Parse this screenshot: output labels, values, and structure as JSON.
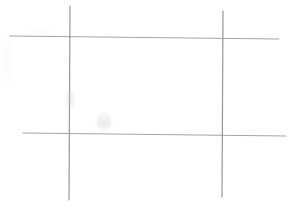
{
  "image": {
    "kind": "hand-drawn-sketch",
    "subject": "grid-of-crossing-lines",
    "width": 293,
    "height": 208,
    "background_color": "#ffffff",
    "medium": "pencil-on-paper",
    "caption": "Hand-drawn grid: two vertical and two horizontal pencil lines crossing to form a hash / tic-tac-toe style frame on blank white paper."
  },
  "palette": {
    "paper": "#ffffff",
    "stroke_dark": "#8d8d92",
    "stroke_mid": "#a3a3a8",
    "stroke_light": "#c4c4c8",
    "smudge": "#d9d9dc"
  },
  "strokes": [
    {
      "id": "vertical-line-left",
      "orientation": "vertical",
      "x1": 70,
      "y1": 6,
      "x2": 69,
      "y2": 200,
      "width": 1.2,
      "color": "#8d8d92",
      "opacity": 0.92
    },
    {
      "id": "vertical-line-right",
      "orientation": "vertical",
      "x1": 223,
      "y1": 11,
      "x2": 222,
      "y2": 197,
      "width": 1.2,
      "color": "#8d8d92",
      "opacity": 0.92
    },
    {
      "id": "horizontal-line-top",
      "orientation": "horizontal",
      "x1": 10,
      "y1": 36,
      "x2": 279,
      "y2": 39,
      "width": 1.1,
      "color": "#9a9a9f",
      "opacity": 0.9
    },
    {
      "id": "horizontal-line-bottom",
      "orientation": "horizontal",
      "x1": 23,
      "y1": 133,
      "x2": 286,
      "y2": 136,
      "width": 1.1,
      "color": "#9a9a9f",
      "opacity": 0.9
    }
  ],
  "intersections": [
    {
      "id": "intersection-top-left",
      "x": 70,
      "y": 37
    },
    {
      "id": "intersection-top-right",
      "x": 223,
      "y": 38
    },
    {
      "id": "intersection-bottom-left",
      "x": 69,
      "y": 134
    },
    {
      "id": "intersection-bottom-right",
      "x": 223,
      "y": 135
    }
  ],
  "smudges": [
    {
      "id": "smudge-center",
      "x": 104,
      "y": 122,
      "rx": 7,
      "ry": 10,
      "opacity": 0.22
    },
    {
      "id": "smudge-left-line",
      "x": 70,
      "y": 100,
      "rx": 4,
      "ry": 9,
      "opacity": 0.18
    }
  ]
}
